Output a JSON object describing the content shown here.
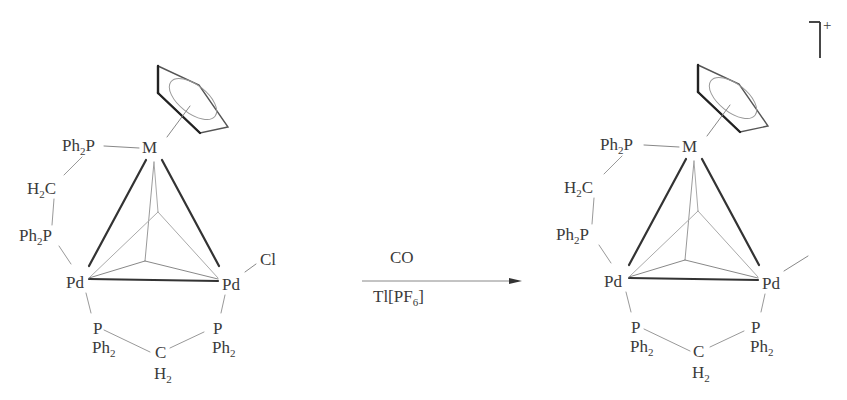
{
  "reactant": {
    "metal": "M",
    "ligand_top": {
      "main": "Ph",
      "sub": "2",
      "tail": "P"
    },
    "bridge_left": {
      "main": "H",
      "sub": "2",
      "tail": "C"
    },
    "ligand_mid": {
      "main": "Ph",
      "sub": "2",
      "tail": "P"
    },
    "pd_left": "Pd",
    "pd_right": "Pd",
    "chloride": "Cl",
    "p_bottom_left": "P",
    "ph2_bottom_left": {
      "main": "Ph",
      "sub": "2"
    },
    "c_bottom": "C",
    "h2_bottom": {
      "main": "H",
      "sub": "2"
    },
    "p_bottom_right": "P",
    "ph2_bottom_right": {
      "main": "Ph",
      "sub": "2"
    }
  },
  "arrow": {
    "reagent_above": "CO",
    "reagent_below": {
      "main": "Tl[PF",
      "sub": "6",
      "tail": "]"
    }
  },
  "product": {
    "metal": "M",
    "ligand_top": {
      "main": "Ph",
      "sub": "2",
      "tail": "P"
    },
    "bridge_left": {
      "main": "H",
      "sub": "2",
      "tail": "C"
    },
    "ligand_mid": {
      "main": "Ph",
      "sub": "2",
      "tail": "P"
    },
    "pd_left": "Pd",
    "pd_right": "Pd",
    "p_bottom_left": "P",
    "ph2_bottom_left": {
      "main": "Ph",
      "sub": "2"
    },
    "c_bottom": "C",
    "h2_bottom": {
      "main": "H",
      "sub": "2"
    },
    "p_bottom_right": "P",
    "ph2_bottom_right": {
      "main": "Ph",
      "sub": "2"
    },
    "charge": "+"
  }
}
